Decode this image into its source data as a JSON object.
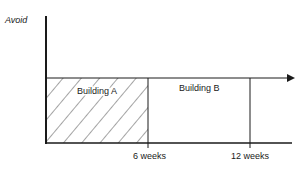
{
  "diagram": {
    "y_axis_label": "Avoid",
    "regions": [
      {
        "label": "Building A",
        "start_weeks": 0,
        "end_weeks": 6,
        "pattern": "hatched"
      },
      {
        "label": "Building B",
        "start_weeks": 6,
        "end_weeks": 12,
        "pattern": "none"
      }
    ],
    "x_ticks": [
      {
        "value": 6,
        "label": "6 weeks"
      },
      {
        "value": 12,
        "label": "12 weeks"
      }
    ],
    "colors": {
      "line": "#1a1a1a",
      "background": "#ffffff"
    }
  }
}
